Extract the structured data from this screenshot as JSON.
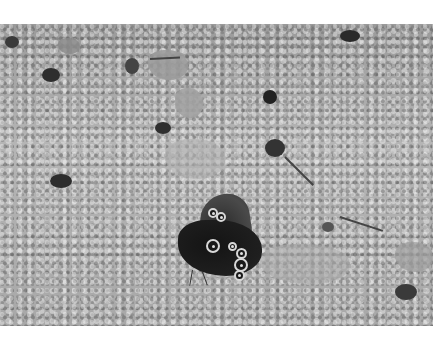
{
  "image": {
    "description": "Grayscale photograph of a dark satyrid butterfly with wings closed, resting on fine gravel with scattered pebbles and debris",
    "subject": "butterfly",
    "background": "gravel ground",
    "color_mode": "grayscale",
    "margins": {
      "top": "#ffffff",
      "bottom": "#ffffff"
    }
  }
}
